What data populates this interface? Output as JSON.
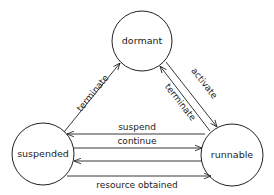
{
  "diagram": {
    "type": "state-transition",
    "states": [
      {
        "id": "dormant",
        "label": "dormant"
      },
      {
        "id": "suspended",
        "label": "suspended"
      },
      {
        "id": "runnable",
        "label": "runnable"
      }
    ],
    "transitions": [
      {
        "from": "suspended",
        "to": "dormant",
        "label": "terminate"
      },
      {
        "from": "runnable",
        "to": "dormant",
        "label": "terminate"
      },
      {
        "from": "dormant",
        "to": "runnable",
        "label": "activate"
      },
      {
        "from": "runnable",
        "to": "suspended",
        "label": "suspend"
      },
      {
        "from": "suspended",
        "to": "runnable",
        "label": "continue"
      },
      {
        "from": "runnable",
        "to": "suspended",
        "label": ""
      },
      {
        "from": "suspended",
        "to": "runnable",
        "label": "resource obtained"
      }
    ]
  }
}
